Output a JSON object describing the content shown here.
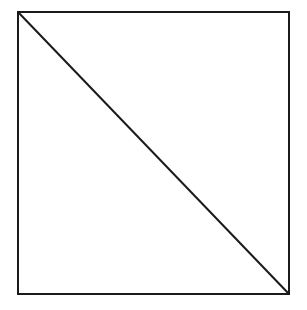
{
  "diagram": {
    "type": "geometric-figure",
    "background_color": "#ffffff",
    "stroke_color": "#1a1a1a",
    "square": {
      "x": 18,
      "y": 12,
      "width": 271,
      "height": 282,
      "stroke_width": 2
    },
    "diagonal": {
      "from": "top-left",
      "to": "bottom-right",
      "x1": 18,
      "y1": 12,
      "x2": 289,
      "y2": 294,
      "stroke_width": 2
    }
  }
}
